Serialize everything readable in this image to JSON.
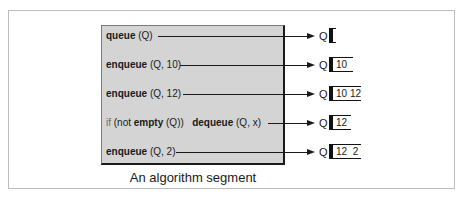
{
  "caption": "An algorithm segment",
  "queue_name": "Q",
  "steps": [
    {
      "statement": {
        "prefix": "",
        "bold": "queue",
        "rest": " (Q)",
        "bold2": "",
        "rest2": ""
      },
      "queue_contents": ""
    },
    {
      "statement": {
        "prefix": "",
        "bold": "enqueue",
        "rest": " (Q, 10)",
        "bold2": "",
        "rest2": ""
      },
      "queue_contents": "10"
    },
    {
      "statement": {
        "prefix": "",
        "bold": "enqueue",
        "rest": " (Q, 12)",
        "bold2": "",
        "rest2": ""
      },
      "queue_contents": "10 12"
    },
    {
      "statement": {
        "prefix": "if",
        "bold": "",
        "rest": " (not ",
        "bold_mid": "empty",
        "rest_mid": " (Q))",
        "bold2": "dequeue",
        "rest2": " (Q, x)"
      },
      "queue_contents": "12"
    },
    {
      "statement": {
        "prefix": "",
        "bold": "enqueue",
        "rest": " (Q, 2)",
        "bold2": "",
        "rest2": ""
      },
      "queue_contents": "12  2"
    }
  ],
  "colors": {
    "algo_box_fill": "#d4d4d4",
    "frame_border": "#bdbdbd",
    "ink": "#1a1a1a"
  }
}
